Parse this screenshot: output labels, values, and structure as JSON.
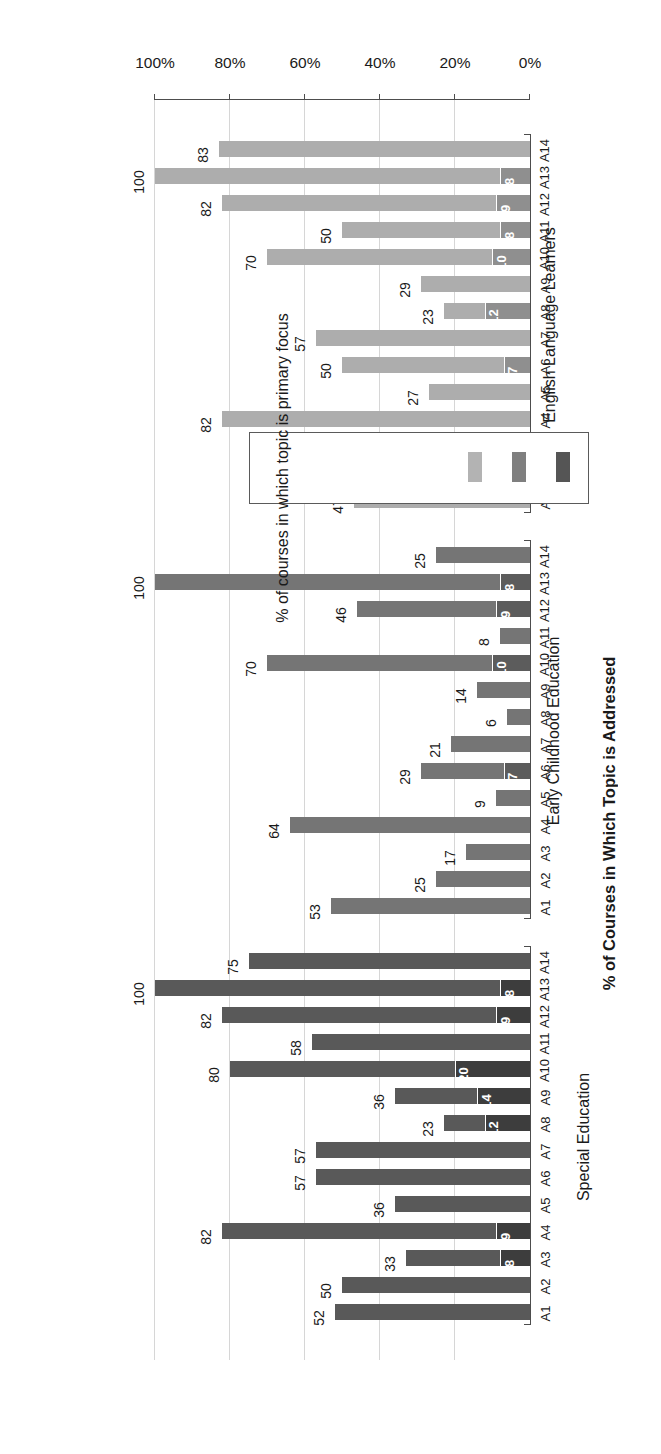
{
  "chart_data": {
    "type": "bar",
    "orientation": "horizontal-grouped-stacked",
    "title": "",
    "xlabel": "",
    "ylabel": "% of Courses in Which Topic is Addressed",
    "ylim": [
      0,
      100
    ],
    "grid": true,
    "tick_labels": [
      "0%",
      "20%",
      "40%",
      "60%",
      "80%",
      "100%"
    ],
    "tick_values": [
      0,
      20,
      40,
      60,
      80,
      100
    ],
    "categories": [
      "A1",
      "A2",
      "A3",
      "A4",
      "A5",
      "A6",
      "A7",
      "A8",
      "A9",
      "A10",
      "A11",
      "A12",
      "A13",
      "A14"
    ],
    "series": [
      {
        "name": "% of Courses in Which Topic is Addressed",
        "role": "total"
      },
      {
        "name": "% of courses in which topic is primary focus",
        "role": "primary"
      }
    ],
    "legend": {
      "position": "bottom-right",
      "title": "% of courses in which topic is primary focus",
      "swatch_colors": [
        "#555555",
        "#7f7f7f",
        "#b3b3b3"
      ]
    },
    "groups": [
      {
        "name": "Special Education",
        "color_total": "#595959",
        "color_primary": "#3d3d3d",
        "bars": [
          {
            "category": "A1",
            "addressed": 52,
            "addressed_label": "52",
            "primary": null,
            "primary_label": ""
          },
          {
            "category": "A2",
            "addressed": 50,
            "addressed_label": "50",
            "primary": null,
            "primary_label": ""
          },
          {
            "category": "A3",
            "addressed": 33,
            "addressed_label": "33",
            "primary": 8,
            "primary_label": "8"
          },
          {
            "category": "A4",
            "addressed": 82,
            "addressed_label": "82",
            "primary": 9,
            "primary_label": "9"
          },
          {
            "category": "A5",
            "addressed": 36,
            "addressed_label": "36",
            "primary": null,
            "primary_label": ""
          },
          {
            "category": "A6",
            "addressed": 57,
            "addressed_label": "57",
            "primary": null,
            "primary_label": ""
          },
          {
            "category": "A7",
            "addressed": 57,
            "addressed_label": "57",
            "primary": null,
            "primary_label": ""
          },
          {
            "category": "A8",
            "addressed": 23,
            "addressed_label": "23",
            "primary": 12,
            "primary_label": "12"
          },
          {
            "category": "A9",
            "addressed": 36,
            "addressed_label": "36",
            "primary": 14,
            "primary_label": "14"
          },
          {
            "category": "A10",
            "addressed": 80,
            "addressed_label": "80",
            "primary": 20,
            "primary_label": "20"
          },
          {
            "category": "A11",
            "addressed": 58,
            "addressed_label": "58",
            "primary": null,
            "primary_label": ""
          },
          {
            "category": "A12",
            "addressed": 82,
            "addressed_label": "82",
            "primary": 9,
            "primary_label": "9"
          },
          {
            "category": "A13",
            "addressed": 100,
            "addressed_label": "100",
            "primary": 8,
            "primary_label": "8"
          },
          {
            "category": "A14",
            "addressed": 75,
            "addressed_label": "75",
            "primary": null,
            "primary_label": ""
          }
        ]
      },
      {
        "name": "Early Childhood Education",
        "color_total": "#757575",
        "color_primary": "#5c5c5c",
        "bars": [
          {
            "category": "A1",
            "addressed": 53,
            "addressed_label": "53",
            "primary": null,
            "primary_label": ""
          },
          {
            "category": "A2",
            "addressed": 25,
            "addressed_label": "25",
            "primary": null,
            "primary_label": ""
          },
          {
            "category": "A3",
            "addressed": 17,
            "addressed_label": "17",
            "primary": null,
            "primary_label": ""
          },
          {
            "category": "A4",
            "addressed": 64,
            "addressed_label": "64",
            "primary": null,
            "primary_label": ""
          },
          {
            "category": "A5",
            "addressed": 9,
            "addressed_label": "9",
            "primary": null,
            "primary_label": ""
          },
          {
            "category": "A6",
            "addressed": 29,
            "addressed_label": "29",
            "primary": 7,
            "primary_label": "7"
          },
          {
            "category": "A7",
            "addressed": 21,
            "addressed_label": "21",
            "primary": null,
            "primary_label": ""
          },
          {
            "category": "A8",
            "addressed": 6,
            "addressed_label": "6",
            "primary": null,
            "primary_label": ""
          },
          {
            "category": "A9",
            "addressed": 14,
            "addressed_label": "14",
            "primary": null,
            "primary_label": ""
          },
          {
            "category": "A10",
            "addressed": 70,
            "addressed_label": "70",
            "primary": 10,
            "primary_label": "10"
          },
          {
            "category": "A11",
            "addressed": 8,
            "addressed_label": "8",
            "primary": null,
            "primary_label": ""
          },
          {
            "category": "A12",
            "addressed": 46,
            "addressed_label": "46",
            "primary": 9,
            "primary_label": "9"
          },
          {
            "category": "A13",
            "addressed": 100,
            "addressed_label": "100",
            "primary": 8,
            "primary_label": "8"
          },
          {
            "category": "A14",
            "addressed": 25,
            "addressed_label": "25",
            "primary": null,
            "primary_label": ""
          }
        ]
      },
      {
        "name": "English Language Learners",
        "color_total": "#adadad",
        "color_primary": "#8f8f8f",
        "bars": [
          {
            "category": "A1",
            "addressed": 47,
            "addressed_label": "47",
            "primary": null,
            "primary_label": ""
          },
          {
            "category": "A2",
            "addressed": 50,
            "addressed_label": "50",
            "primary": null,
            "primary_label": ""
          },
          {
            "category": "A3",
            "addressed": 25,
            "addressed_label": "25",
            "primary": null,
            "primary_label": ""
          },
          {
            "category": "A4",
            "addressed": 82,
            "addressed_label": "82",
            "primary": null,
            "primary_label": ""
          },
          {
            "category": "A5",
            "addressed": 27,
            "addressed_label": "27",
            "primary": null,
            "primary_label": ""
          },
          {
            "category": "A6",
            "addressed": 50,
            "addressed_label": "50",
            "primary": 7,
            "primary_label": "7"
          },
          {
            "category": "A7",
            "addressed": 57,
            "addressed_label": "57",
            "primary": null,
            "primary_label": ""
          },
          {
            "category": "A8",
            "addressed": 23,
            "addressed_label": "23",
            "primary": 12,
            "primary_label": "12"
          },
          {
            "category": "A9",
            "addressed": 29,
            "addressed_label": "29",
            "primary": null,
            "primary_label": ""
          },
          {
            "category": "A10",
            "addressed": 70,
            "addressed_label": "70",
            "primary": 10,
            "primary_label": "10"
          },
          {
            "category": "A11",
            "addressed": 50,
            "addressed_label": "50",
            "primary": 8,
            "primary_label": "8"
          },
          {
            "category": "A12",
            "addressed": 82,
            "addressed_label": "82",
            "primary": 9,
            "primary_label": "9"
          },
          {
            "category": "A13",
            "addressed": 100,
            "addressed_label": "100",
            "primary": 8,
            "primary_label": "8"
          },
          {
            "category": "A14",
            "addressed": 83,
            "addressed_label": "83",
            "primary": null,
            "primary_label": ""
          }
        ]
      }
    ]
  }
}
